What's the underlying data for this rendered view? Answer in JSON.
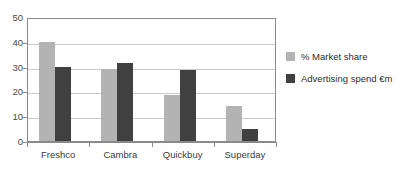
{
  "chart_data": {
    "type": "bar",
    "title": "",
    "xlabel": "",
    "ylabel": "",
    "ylim": [
      0,
      50
    ],
    "yticks": [
      0,
      10,
      20,
      30,
      40,
      50
    ],
    "grid": true,
    "legend_position": "right",
    "categories": [
      "Freshco",
      "Cambra",
      "Quickbuy",
      "Superday"
    ],
    "series": [
      {
        "name": "% Market share",
        "color": "#b3b3b3",
        "values": [
          40,
          29,
          18.5,
          14
        ]
      },
      {
        "name": "Advertising spend €m",
        "color": "#404040",
        "values": [
          30,
          31.5,
          28.5,
          5
        ]
      }
    ]
  },
  "axis": {
    "y_tick_labels": [
      "0",
      "10",
      "20",
      "30",
      "40",
      "50"
    ]
  },
  "legend": {
    "items": [
      {
        "label": "% Market share",
        "color": "#b3b3b3"
      },
      {
        "label": "Advertising spend €m",
        "color": "#404040"
      }
    ]
  },
  "colors": {
    "series_light": "#b3b3b3",
    "series_dark": "#404040",
    "gridline": "#c9c9c9",
    "axis": "#8a8a8a",
    "text": "#3a3a3a",
    "background": "#ffffff"
  }
}
